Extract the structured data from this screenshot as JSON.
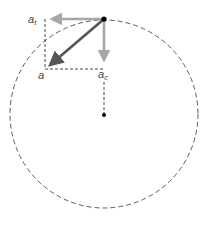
{
  "diagram": {
    "type": "circular-motion-acceleration-components",
    "labels": {
      "total": "a",
      "tangential": "a",
      "tangential_sub": "t",
      "centripetal": "a",
      "centripetal_sub": "c"
    },
    "colors": {
      "total_arrow": "#555555",
      "component_arrow": "#a6a6a6",
      "dashed": "#333333",
      "dot": "#000000"
    }
  }
}
